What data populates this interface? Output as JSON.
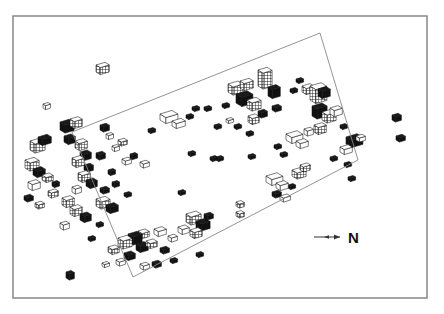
{
  "figure": {
    "kind": "axonometric-3d-building-massing-map",
    "title": "",
    "background_color": "#ffffff",
    "ink_color": "#111111"
  },
  "frame": {
    "name": "plot-border",
    "x": 13,
    "y": 16,
    "width": 414,
    "height": 282,
    "stroke_color": "#8f8f8f",
    "stroke_width": 1.6
  },
  "site_boundary": {
    "name": "site-boundary-polygon",
    "stroke_color": "#888888",
    "stroke_width": 0.9,
    "fill": "none",
    "points": [
      [
        72,
        132
      ],
      [
        320,
        33
      ],
      [
        358,
        160
      ],
      [
        133,
        277
      ]
    ]
  },
  "north_arrow": {
    "label": "N",
    "label_x": 348,
    "label_y": 243,
    "line_x1": 314,
    "line_x2": 340,
    "line_y": 237,
    "stroke_color": "#333333"
  },
  "legend": {
    "items": []
  },
  "chart_data": {
    "type": "scatter",
    "title": "",
    "xlabel": "",
    "ylabel": "",
    "grid": false,
    "legend_position": "none",
    "note": "Each datum is a 3D isometric building block drawn at map position (x,y) with plan size (w,d) and height h in pixel units; fill encodes facade shading: 'solid' = dark, 'grid' = hatched/windowed, 'light' = outline only.",
    "xlim": [
      13,
      427
    ],
    "ylim": [
      16,
      298
    ],
    "buildings": [
      {
        "x": 96,
        "y": 72,
        "w": 9,
        "d": 5,
        "h": 7,
        "fill": "grid"
      },
      {
        "x": 43,
        "y": 108,
        "w": 5,
        "d": 3,
        "h": 4,
        "fill": "light"
      },
      {
        "x": 30,
        "y": 150,
        "w": 10,
        "d": 6,
        "h": 9,
        "fill": "grid"
      },
      {
        "x": 38,
        "y": 143,
        "w": 9,
        "d": 5,
        "h": 6,
        "fill": "solid"
      },
      {
        "x": 25,
        "y": 168,
        "w": 9,
        "d": 6,
        "h": 8,
        "fill": "grid"
      },
      {
        "x": 33,
        "y": 175,
        "w": 8,
        "d": 5,
        "h": 6,
        "fill": "solid"
      },
      {
        "x": 42,
        "y": 180,
        "w": 7,
        "d": 5,
        "h": 5,
        "fill": "grid"
      },
      {
        "x": 28,
        "y": 188,
        "w": 8,
        "d": 5,
        "h": 6,
        "fill": "light"
      },
      {
        "x": 48,
        "y": 196,
        "w": 7,
        "d": 4,
        "h": 5,
        "fill": "grid"
      },
      {
        "x": 24,
        "y": 200,
        "w": 6,
        "d": 4,
        "h": 4,
        "fill": "solid"
      },
      {
        "x": 35,
        "y": 207,
        "w": 6,
        "d": 4,
        "h": 4,
        "fill": "grid"
      },
      {
        "x": 60,
        "y": 130,
        "w": 9,
        "d": 6,
        "h": 8,
        "fill": "solid"
      },
      {
        "x": 70,
        "y": 126,
        "w": 8,
        "d": 5,
        "h": 7,
        "fill": "grid"
      },
      {
        "x": 64,
        "y": 142,
        "w": 7,
        "d": 5,
        "h": 6,
        "fill": "solid"
      },
      {
        "x": 75,
        "y": 148,
        "w": 8,
        "d": 5,
        "h": 7,
        "fill": "grid"
      },
      {
        "x": 80,
        "y": 158,
        "w": 7,
        "d": 5,
        "h": 6,
        "fill": "solid"
      },
      {
        "x": 72,
        "y": 165,
        "w": 8,
        "d": 5,
        "h": 7,
        "fill": "grid"
      },
      {
        "x": 84,
        "y": 170,
        "w": 6,
        "d": 4,
        "h": 5,
        "fill": "solid"
      },
      {
        "x": 78,
        "y": 180,
        "w": 8,
        "d": 5,
        "h": 7,
        "fill": "grid"
      },
      {
        "x": 86,
        "y": 186,
        "w": 7,
        "d": 5,
        "h": 6,
        "fill": "solid"
      },
      {
        "x": 72,
        "y": 192,
        "w": 6,
        "d": 4,
        "h": 5,
        "fill": "light"
      },
      {
        "x": 62,
        "y": 205,
        "w": 8,
        "d": 5,
        "h": 7,
        "fill": "grid"
      },
      {
        "x": 70,
        "y": 214,
        "w": 8,
        "d": 5,
        "h": 7,
        "fill": "grid"
      },
      {
        "x": 80,
        "y": 220,
        "w": 7,
        "d": 5,
        "h": 6,
        "fill": "solid"
      },
      {
        "x": 60,
        "y": 228,
        "w": 6,
        "d": 4,
        "h": 5,
        "fill": "light"
      },
      {
        "x": 52,
        "y": 186,
        "w": 5,
        "d": 3,
        "h": 4,
        "fill": "solid"
      },
      {
        "x": 100,
        "y": 130,
        "w": 6,
        "d": 4,
        "h": 5,
        "fill": "solid"
      },
      {
        "x": 106,
        "y": 138,
        "w": 5,
        "d": 3,
        "h": 4,
        "fill": "light"
      },
      {
        "x": 112,
        "y": 150,
        "w": 5,
        "d": 3,
        "h": 4,
        "fill": "light"
      },
      {
        "x": 118,
        "y": 144,
        "w": 6,
        "d": 4,
        "h": 4,
        "fill": "grid"
      },
      {
        "x": 96,
        "y": 158,
        "w": 6,
        "d": 4,
        "h": 5,
        "fill": "solid"
      },
      {
        "x": 122,
        "y": 163,
        "w": 6,
        "d": 4,
        "h": 4,
        "fill": "light"
      },
      {
        "x": 130,
        "y": 158,
        "w": 5,
        "d": 3,
        "h": 4,
        "fill": "solid"
      },
      {
        "x": 140,
        "y": 166,
        "w": 6,
        "d": 4,
        "h": 4,
        "fill": "light"
      },
      {
        "x": 108,
        "y": 174,
        "w": 5,
        "d": 3,
        "h": 4,
        "fill": "solid"
      },
      {
        "x": 100,
        "y": 192,
        "w": 6,
        "d": 4,
        "h": 4,
        "fill": "solid"
      },
      {
        "x": 112,
        "y": 186,
        "w": 5,
        "d": 3,
        "h": 4,
        "fill": "solid"
      },
      {
        "x": 124,
        "y": 196,
        "w": 5,
        "d": 3,
        "h": 3,
        "fill": "solid"
      },
      {
        "x": 96,
        "y": 206,
        "w": 9,
        "d": 6,
        "h": 7,
        "fill": "grid"
      },
      {
        "x": 106,
        "y": 211,
        "w": 8,
        "d": 5,
        "h": 6,
        "fill": "solid"
      },
      {
        "x": 148,
        "y": 132,
        "w": 5,
        "d": 3,
        "h": 3,
        "fill": "solid"
      },
      {
        "x": 160,
        "y": 120,
        "w": 12,
        "d": 7,
        "h": 6,
        "fill": "light"
      },
      {
        "x": 172,
        "y": 126,
        "w": 9,
        "d": 5,
        "h": 5,
        "fill": "light"
      },
      {
        "x": 186,
        "y": 118,
        "w": 5,
        "d": 3,
        "h": 3,
        "fill": "solid"
      },
      {
        "x": 192,
        "y": 110,
        "w": 5,
        "d": 3,
        "h": 3,
        "fill": "solid"
      },
      {
        "x": 204,
        "y": 110,
        "w": 5,
        "d": 3,
        "h": 3,
        "fill": "solid"
      },
      {
        "x": 188,
        "y": 155,
        "w": 5,
        "d": 3,
        "h": 3,
        "fill": "solid"
      },
      {
        "x": 210,
        "y": 160,
        "w": 5,
        "d": 3,
        "h": 3,
        "fill": "solid"
      },
      {
        "x": 222,
        "y": 107,
        "w": 5,
        "d": 3,
        "h": 3,
        "fill": "solid"
      },
      {
        "x": 228,
        "y": 92,
        "w": 10,
        "d": 6,
        "h": 8,
        "fill": "grid"
      },
      {
        "x": 240,
        "y": 88,
        "w": 9,
        "d": 5,
        "h": 7,
        "fill": "grid"
      },
      {
        "x": 236,
        "y": 103,
        "w": 11,
        "d": 7,
        "h": 9,
        "fill": "solid"
      },
      {
        "x": 247,
        "y": 108,
        "w": 9,
        "d": 6,
        "h": 8,
        "fill": "grid"
      },
      {
        "x": 258,
        "y": 86,
        "w": 9,
        "d": 6,
        "h": 16,
        "fill": "grid"
      },
      {
        "x": 268,
        "y": 96,
        "w": 8,
        "d": 5,
        "h": 9,
        "fill": "solid"
      },
      {
        "x": 248,
        "y": 122,
        "w": 7,
        "d": 5,
        "h": 6,
        "fill": "grid"
      },
      {
        "x": 258,
        "y": 116,
        "w": 6,
        "d": 4,
        "h": 5,
        "fill": "solid"
      },
      {
        "x": 272,
        "y": 110,
        "w": 6,
        "d": 4,
        "h": 4,
        "fill": "solid"
      },
      {
        "x": 226,
        "y": 122,
        "w": 5,
        "d": 3,
        "h": 3,
        "fill": "light"
      },
      {
        "x": 234,
        "y": 128,
        "w": 5,
        "d": 3,
        "h": 3,
        "fill": "solid"
      },
      {
        "x": 246,
        "y": 135,
        "w": 5,
        "d": 3,
        "h": 3,
        "fill": "solid"
      },
      {
        "x": 214,
        "y": 128,
        "w": 5,
        "d": 3,
        "h": 3,
        "fill": "solid"
      },
      {
        "x": 290,
        "y": 92,
        "w": 5,
        "d": 3,
        "h": 3,
        "fill": "solid"
      },
      {
        "x": 296,
        "y": 82,
        "w": 5,
        "d": 3,
        "h": 3,
        "fill": "solid"
      },
      {
        "x": 302,
        "y": 92,
        "w": 8,
        "d": 5,
        "h": 6,
        "fill": "grid"
      },
      {
        "x": 310,
        "y": 100,
        "w": 11,
        "d": 7,
        "h": 14,
        "fill": "grid"
      },
      {
        "x": 318,
        "y": 96,
        "w": 8,
        "d": 5,
        "h": 7,
        "fill": "solid"
      },
      {
        "x": 312,
        "y": 116,
        "w": 10,
        "d": 6,
        "h": 10,
        "fill": "solid"
      },
      {
        "x": 322,
        "y": 120,
        "w": 9,
        "d": 6,
        "h": 8,
        "fill": "grid"
      },
      {
        "x": 330,
        "y": 114,
        "w": 8,
        "d": 5,
        "h": 6,
        "fill": "light"
      },
      {
        "x": 314,
        "y": 132,
        "w": 8,
        "d": 5,
        "h": 7,
        "fill": "grid"
      },
      {
        "x": 304,
        "y": 134,
        "w": 6,
        "d": 4,
        "h": 5,
        "fill": "light"
      },
      {
        "x": 340,
        "y": 128,
        "w": 5,
        "d": 3,
        "h": 3,
        "fill": "solid"
      },
      {
        "x": 346,
        "y": 144,
        "w": 11,
        "d": 7,
        "h": 7,
        "fill": "solid"
      },
      {
        "x": 340,
        "y": 152,
        "w": 8,
        "d": 5,
        "h": 5,
        "fill": "light"
      },
      {
        "x": 356,
        "y": 140,
        "w": 6,
        "d": 4,
        "h": 4,
        "fill": "light"
      },
      {
        "x": 286,
        "y": 140,
        "w": 11,
        "d": 7,
        "h": 6,
        "fill": "light"
      },
      {
        "x": 296,
        "y": 146,
        "w": 8,
        "d": 5,
        "h": 5,
        "fill": "light"
      },
      {
        "x": 274,
        "y": 148,
        "w": 5,
        "d": 3,
        "h": 3,
        "fill": "solid"
      },
      {
        "x": 280,
        "y": 156,
        "w": 5,
        "d": 3,
        "h": 3,
        "fill": "solid"
      },
      {
        "x": 344,
        "y": 166,
        "w": 5,
        "d": 3,
        "h": 3,
        "fill": "solid"
      },
      {
        "x": 330,
        "y": 160,
        "w": 5,
        "d": 3,
        "h": 3,
        "fill": "solid"
      },
      {
        "x": 348,
        "y": 180,
        "w": 5,
        "d": 3,
        "h": 3,
        "fill": "solid"
      },
      {
        "x": 392,
        "y": 120,
        "w": 6,
        "d": 4,
        "h": 5,
        "fill": "solid"
      },
      {
        "x": 396,
        "y": 140,
        "w": 6,
        "d": 4,
        "h": 4,
        "fill": "solid"
      },
      {
        "x": 292,
        "y": 176,
        "w": 9,
        "d": 6,
        "h": 6,
        "fill": "grid"
      },
      {
        "x": 300,
        "y": 170,
        "w": 7,
        "d": 4,
        "h": 5,
        "fill": "grid"
      },
      {
        "x": 288,
        "y": 188,
        "w": 5,
        "d": 3,
        "h": 3,
        "fill": "solid"
      },
      {
        "x": 266,
        "y": 182,
        "w": 11,
        "d": 7,
        "h": 6,
        "fill": "light"
      },
      {
        "x": 276,
        "y": 188,
        "w": 8,
        "d": 5,
        "h": 5,
        "fill": "light"
      },
      {
        "x": 272,
        "y": 196,
        "w": 6,
        "d": 4,
        "h": 4,
        "fill": "solid"
      },
      {
        "x": 280,
        "y": 200,
        "w": 7,
        "d": 4,
        "h": 4,
        "fill": "light"
      },
      {
        "x": 236,
        "y": 206,
        "w": 5,
        "d": 4,
        "h": 4,
        "fill": "grid"
      },
      {
        "x": 236,
        "y": 216,
        "w": 5,
        "d": 4,
        "h": 4,
        "fill": "grid"
      },
      {
        "x": 216,
        "y": 160,
        "w": 5,
        "d": 3,
        "h": 3,
        "fill": "solid"
      },
      {
        "x": 248,
        "y": 158,
        "w": 5,
        "d": 3,
        "h": 3,
        "fill": "solid"
      },
      {
        "x": 178,
        "y": 194,
        "w": 5,
        "d": 3,
        "h": 3,
        "fill": "solid"
      },
      {
        "x": 186,
        "y": 222,
        "w": 10,
        "d": 6,
        "h": 8,
        "fill": "grid"
      },
      {
        "x": 196,
        "y": 228,
        "w": 9,
        "d": 6,
        "h": 7,
        "fill": "solid"
      },
      {
        "x": 190,
        "y": 236,
        "w": 8,
        "d": 5,
        "h": 6,
        "fill": "grid"
      },
      {
        "x": 178,
        "y": 232,
        "w": 7,
        "d": 5,
        "h": 5,
        "fill": "light"
      },
      {
        "x": 204,
        "y": 218,
        "w": 6,
        "d": 4,
        "h": 4,
        "fill": "solid"
      },
      {
        "x": 168,
        "y": 240,
        "w": 6,
        "d": 4,
        "h": 4,
        "fill": "light"
      },
      {
        "x": 154,
        "y": 234,
        "w": 8,
        "d": 5,
        "h": 5,
        "fill": "light"
      },
      {
        "x": 138,
        "y": 236,
        "w": 7,
        "d": 5,
        "h": 5,
        "fill": "grid"
      },
      {
        "x": 128,
        "y": 242,
        "w": 9,
        "d": 6,
        "h": 8,
        "fill": "solid"
      },
      {
        "x": 118,
        "y": 246,
        "w": 9,
        "d": 6,
        "h": 8,
        "fill": "grid"
      },
      {
        "x": 136,
        "y": 250,
        "w": 8,
        "d": 5,
        "h": 6,
        "fill": "solid"
      },
      {
        "x": 146,
        "y": 246,
        "w": 7,
        "d": 5,
        "h": 5,
        "fill": "grid"
      },
      {
        "x": 108,
        "y": 252,
        "w": 7,
        "d": 5,
        "h": 5,
        "fill": "grid"
      },
      {
        "x": 124,
        "y": 258,
        "w": 7,
        "d": 5,
        "h": 5,
        "fill": "solid"
      },
      {
        "x": 116,
        "y": 264,
        "w": 6,
        "d": 4,
        "h": 4,
        "fill": "light"
      },
      {
        "x": 160,
        "y": 252,
        "w": 6,
        "d": 4,
        "h": 4,
        "fill": "solid"
      },
      {
        "x": 102,
        "y": 266,
        "w": 5,
        "d": 3,
        "h": 3,
        "fill": "light"
      },
      {
        "x": 152,
        "y": 266,
        "w": 6,
        "d": 4,
        "h": 4,
        "fill": "solid"
      },
      {
        "x": 196,
        "y": 256,
        "w": 5,
        "d": 3,
        "h": 3,
        "fill": "solid"
      },
      {
        "x": 140,
        "y": 268,
        "w": 6,
        "d": 4,
        "h": 4,
        "fill": "light"
      },
      {
        "x": 170,
        "y": 262,
        "w": 5,
        "d": 3,
        "h": 3,
        "fill": "solid"
      },
      {
        "x": 88,
        "y": 240,
        "w": 5,
        "d": 3,
        "h": 3,
        "fill": "solid"
      },
      {
        "x": 96,
        "y": 226,
        "w": 5,
        "d": 3,
        "h": 3,
        "fill": "solid"
      },
      {
        "x": 66,
        "y": 278,
        "w": 5,
        "d": 4,
        "h": 6,
        "fill": "solid"
      }
    ]
  }
}
